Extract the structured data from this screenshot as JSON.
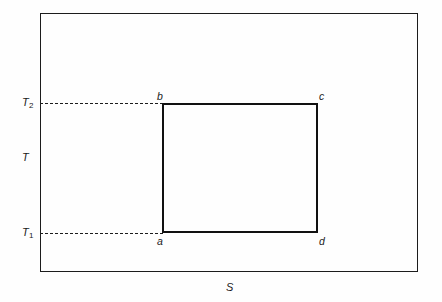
{
  "figure": {
    "type": "diagram",
    "background_color": "#fefefe",
    "line_color": "#1c1c1c"
  },
  "axes": {
    "vertical_label": "T",
    "horizontal_label": "S"
  },
  "ticks": {
    "upper": {
      "symbol": "T",
      "subscript": "2"
    },
    "lower": {
      "symbol": "T",
      "subscript": "1"
    }
  },
  "corners": {
    "bottom_left": "a",
    "top_left": "b",
    "top_right": "c",
    "bottom_right": "d"
  },
  "shapes": {
    "outer_rectangle": {
      "x": 40,
      "y": 13,
      "width": 378,
      "height": 259
    },
    "inner_rectangle": {
      "x": 162,
      "y": 103,
      "width": 156,
      "height": 130
    }
  },
  "guides": {
    "upper_dashed": {
      "from_x": 40,
      "to_x": 163,
      "y": 103
    },
    "lower_dashed": {
      "from_x": 40,
      "to_x": 163,
      "y": 233
    }
  }
}
